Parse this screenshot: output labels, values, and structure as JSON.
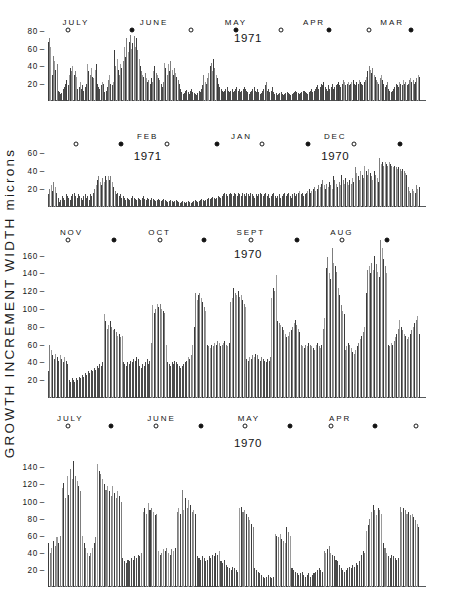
{
  "axis_title": "GROWTH   INCREMENT   WIDTH   microns",
  "chart_data": {
    "type": "bar",
    "title": "GROWTH INCREMENT WIDTH microns",
    "xlabel": "",
    "ylabel": "microns",
    "grid": false,
    "legend": "none",
    "note": "Four stacked panels of daily growth increment widths; time runs right-to-left. Open circle = full moon, filled circle = new moon.",
    "panels": [
      {
        "id": "panel-1",
        "year_label": "1971",
        "ylim": [
          0,
          88
        ],
        "yticks": [
          20,
          40,
          60,
          80
        ],
        "months": [
          "JULY",
          "JUNE",
          "MAY",
          "APR",
          "MAR"
        ],
        "moons": [
          {
            "phase": "full",
            "x": 0.055
          },
          {
            "phase": "new",
            "x": 0.225
          },
          {
            "phase": "full",
            "x": 0.385
          },
          {
            "phase": "new",
            "x": 0.505
          },
          {
            "phase": "full",
            "x": 0.625
          },
          {
            "phase": "new",
            "x": 0.755
          },
          {
            "phase": "full",
            "x": 0.862
          },
          {
            "phase": "new",
            "x": 0.975
          }
        ],
        "values": [
          68,
          72,
          62,
          30,
          52,
          46,
          36,
          42,
          12,
          10,
          8,
          9,
          14,
          16,
          20,
          24,
          18,
          30,
          38,
          34,
          40,
          30,
          34,
          28,
          14,
          16,
          22,
          14,
          18,
          12,
          16,
          20,
          42,
          34,
          30,
          38,
          28,
          26,
          36,
          42,
          20,
          16,
          14,
          18,
          22,
          20,
          10,
          12,
          16,
          24,
          30,
          20,
          18,
          22,
          58,
          40,
          48,
          36,
          30,
          42,
          38,
          46,
          62,
          50,
          72,
          56,
          68,
          76,
          60,
          66,
          74,
          62,
          72,
          58,
          48,
          40,
          34,
          30,
          28,
          32,
          26,
          22,
          24,
          20,
          26,
          22,
          34,
          40,
          32,
          30,
          26,
          24,
          20,
          16,
          22,
          44,
          38,
          30,
          42,
          34,
          46,
          36,
          30,
          38,
          32,
          28,
          24,
          20,
          14,
          10,
          8,
          9,
          11,
          13,
          10,
          8,
          12,
          14,
          10,
          9,
          8,
          7,
          9,
          12,
          10,
          14,
          18,
          30,
          22,
          20,
          26,
          32,
          40,
          44,
          34,
          48,
          38,
          30,
          26,
          20,
          16,
          14,
          12,
          10,
          12,
          14,
          16,
          12,
          10,
          12,
          14,
          10,
          12,
          14,
          16,
          12,
          14,
          10,
          12,
          14,
          16,
          14,
          12,
          10,
          8,
          10,
          12,
          14,
          16,
          12,
          10,
          14,
          10,
          8,
          9,
          11,
          14,
          18,
          22,
          12,
          14,
          10,
          12,
          16,
          10,
          8,
          9,
          7,
          8,
          9,
          10,
          8,
          7,
          8,
          9,
          10,
          9,
          8,
          7,
          8,
          9,
          10,
          12,
          10,
          9,
          8,
          9,
          10,
          11,
          12,
          10,
          9,
          8,
          10,
          12,
          14,
          10,
          12,
          14,
          16,
          18,
          14,
          16,
          20,
          18,
          22,
          16,
          14,
          12,
          18,
          14,
          16,
          20,
          14,
          16,
          18,
          20,
          22,
          18,
          16,
          20,
          24,
          22,
          18,
          20,
          22,
          18,
          20,
          22,
          24,
          20,
          18,
          22,
          20,
          24,
          22,
          20,
          18,
          22,
          24,
          28,
          34,
          40,
          36,
          32,
          38,
          30,
          28,
          24,
          22,
          20,
          26,
          30,
          24,
          20,
          16,
          18,
          22,
          14,
          12,
          10,
          12,
          14,
          16,
          20,
          18,
          16,
          22,
          20,
          18,
          24,
          20,
          22,
          18,
          20,
          24,
          26,
          22,
          24,
          20,
          22,
          26,
          30,
          28
        ]
      },
      {
        "id": "panel-2",
        "year_labels": [
          "1971",
          "1970"
        ],
        "ylim": [
          0,
          70
        ],
        "yticks": [
          20,
          40,
          60
        ],
        "months": [
          "FEB",
          "JAN",
          "DEC"
        ],
        "moons": [
          {
            "phase": "full",
            "x": 0.075
          },
          {
            "phase": "new",
            "x": 0.195
          },
          {
            "phase": "full",
            "x": 0.32
          },
          {
            "phase": "new",
            "x": 0.455
          },
          {
            "phase": "full",
            "x": 0.575
          },
          {
            "phase": "new",
            "x": 0.7
          },
          {
            "phase": "full",
            "x": 0.822
          },
          {
            "phase": "new",
            "x": 0.945
          }
        ],
        "values": [
          14,
          20,
          24,
          18,
          28,
          22,
          16,
          10,
          6,
          8,
          12,
          10,
          8,
          14,
          12,
          10,
          8,
          12,
          14,
          16,
          12,
          10,
          14,
          12,
          10,
          8,
          12,
          14,
          10,
          12,
          8,
          14,
          12,
          16,
          20,
          24,
          30,
          34,
          28,
          24,
          32,
          28,
          34,
          30,
          34,
          30,
          34,
          28,
          22,
          18,
          14,
          16,
          12,
          14,
          10,
          12,
          10,
          8,
          10,
          9,
          8,
          10,
          12,
          10,
          9,
          8,
          10,
          9,
          8,
          10,
          12,
          9,
          8,
          10,
          9,
          8,
          10,
          9,
          8,
          7,
          8,
          9,
          8,
          7,
          8,
          9,
          8,
          7,
          6,
          7,
          8,
          7,
          6,
          7,
          8,
          7,
          6,
          5,
          6,
          7,
          6,
          5,
          6,
          7,
          6,
          5,
          6,
          7,
          8,
          7,
          6,
          7,
          8,
          9,
          8,
          7,
          8,
          9,
          10,
          9,
          10,
          11,
          10,
          9,
          10,
          12,
          11,
          10,
          12,
          14,
          16,
          14,
          12,
          14,
          16,
          14,
          12,
          16,
          14,
          12,
          16,
          14,
          12,
          16,
          14,
          12,
          16,
          14,
          12,
          16,
          14,
          12,
          10,
          14,
          12,
          14,
          16,
          14,
          12,
          14,
          16,
          12,
          14,
          10,
          12,
          14,
          16,
          12,
          10,
          12,
          14,
          10,
          12,
          14,
          16,
          12,
          14,
          16,
          12,
          10,
          14,
          16,
          12,
          14,
          16,
          18,
          14,
          16,
          12,
          14,
          16,
          18,
          20,
          16,
          18,
          20,
          22,
          18,
          20,
          24,
          22,
          26,
          30,
          24,
          20,
          26,
          22,
          28,
          24,
          20,
          34,
          30,
          26,
          22,
          28,
          24,
          36,
          30,
          26,
          32,
          28,
          24,
          30,
          26,
          32,
          28,
          44,
          38,
          34,
          30,
          40,
          36,
          32,
          46,
          40,
          36,
          42,
          38,
          34,
          30,
          40,
          36,
          32,
          28,
          54,
          48,
          50,
          46,
          50,
          48,
          46,
          50,
          48,
          46,
          44,
          46,
          44,
          42,
          44,
          42,
          40,
          42,
          40,
          38,
          36,
          22,
          18,
          16,
          20,
          18,
          16,
          24,
          20,
          22
        ]
      },
      {
        "id": "panel-3",
        "year_label": "1970",
        "ylim": [
          0,
          182
        ],
        "yticks": [
          20,
          40,
          60,
          80,
          100,
          120,
          140,
          160
        ],
        "months": [
          "NOV",
          "OCT",
          "SEPT",
          "AUG"
        ],
        "moons": [
          {
            "phase": "full",
            "x": 0.055
          },
          {
            "phase": "new",
            "x": 0.178
          },
          {
            "phase": "full",
            "x": 0.3
          },
          {
            "phase": "new",
            "x": 0.42
          },
          {
            "phase": "full",
            "x": 0.545
          },
          {
            "phase": "new",
            "x": 0.67
          },
          {
            "phase": "full",
            "x": 0.79
          },
          {
            "phase": "new",
            "x": 0.912
          }
        ],
        "values": [
          30,
          60,
          54,
          48,
          44,
          50,
          46,
          42,
          48,
          44,
          40,
          46,
          42,
          38,
          20,
          18,
          22,
          20,
          18,
          22,
          20,
          24,
          22,
          26,
          24,
          28,
          26,
          30,
          28,
          32,
          30,
          34,
          32,
          36,
          34,
          38,
          36,
          40,
          94,
          86,
          78,
          82,
          86,
          80,
          76,
          78,
          74,
          70,
          72,
          68,
          70,
          40,
          38,
          36,
          40,
          38,
          42,
          40,
          44,
          42,
          46,
          44,
          36,
          34,
          38,
          36,
          40,
          44,
          38,
          42,
          62,
          104,
          96,
          100,
          106,
          102,
          106,
          100,
          98,
          96,
          60,
          40,
          38,
          36,
          40,
          38,
          42,
          40,
          38,
          36,
          34,
          36,
          38,
          40,
          42,
          46,
          44,
          48,
          60,
          80,
          118,
          110,
          116,
          118,
          112,
          108,
          102,
          98,
          60,
          58,
          56,
          60,
          58,
          62,
          60,
          64,
          62,
          58,
          60,
          62,
          64,
          60,
          58,
          62,
          108,
          112,
          124,
          118,
          116,
          120,
          114,
          116,
          110,
          106,
          102,
          44,
          42,
          46,
          44,
          48,
          46,
          50,
          48,
          44,
          42,
          46,
          44,
          42,
          40,
          44,
          42,
          46,
          112,
          124,
          120,
          138,
          86,
          84,
          82,
          80,
          76,
          72,
          68,
          70,
          74,
          76,
          80,
          84,
          88,
          82,
          78,
          74,
          60,
          58,
          56,
          60,
          58,
          62,
          60,
          58,
          56,
          54,
          60,
          62,
          58,
          56,
          60,
          78,
          90,
          146,
          158,
          140,
          134,
          168,
          152,
          148,
          142,
          124,
          116,
          104,
          98,
          94,
          54,
          58,
          62,
          60,
          56,
          52,
          50,
          54,
          58,
          62,
          66,
          70,
          74,
          80,
          118,
          144,
          148,
          140,
          152,
          144,
          160,
          150,
          142,
          136,
          178,
          168,
          156,
          148,
          140,
          60,
          58,
          62,
          60,
          64,
          68,
          72,
          78,
          88,
          80,
          76,
          72,
          70,
          66,
          68,
          72,
          76,
          80,
          84,
          88,
          92,
          72
        ]
      },
      {
        "id": "panel-4",
        "year_label": "1970",
        "ylim": [
          0,
          158
        ],
        "yticks": [
          20,
          40,
          60,
          80,
          100,
          120,
          140
        ],
        "months": [
          "JULY",
          "JUNE",
          "MAY",
          "APR"
        ],
        "moons": [
          {
            "phase": "full",
            "x": 0.054
          },
          {
            "phase": "new",
            "x": 0.17
          },
          {
            "phase": "full",
            "x": 0.29
          },
          {
            "phase": "new",
            "x": 0.41
          },
          {
            "phase": "full",
            "x": 0.53
          },
          {
            "phase": "new",
            "x": 0.65
          },
          {
            "phase": "full",
            "x": 0.762
          },
          {
            "phase": "new",
            "x": 0.878
          },
          {
            "phase": "full",
            "x": 0.99
          }
        ],
        "values": [
          52,
          40,
          46,
          54,
          48,
          58,
          52,
          60,
          116,
          122,
          104,
          130,
          108,
          138,
          126,
          148,
          130,
          124,
          118,
          112,
          60,
          52,
          46,
          40,
          36,
          40,
          46,
          52,
          58,
          144,
          136,
          132,
          126,
          120,
          114,
          118,
          112,
          106,
          118,
          110,
          104,
          112,
          106,
          100,
          34,
          30,
          28,
          32,
          30,
          34,
          32,
          36,
          34,
          38,
          36,
          40,
          88,
          92,
          86,
          98,
          90,
          92,
          88,
          84,
          86,
          42,
          38,
          40,
          44,
          42,
          46,
          40,
          38,
          44,
          42,
          46,
          88,
          92,
          86,
          114,
          90,
          104,
          92,
          102,
          96,
          88,
          90,
          86,
          36,
          34,
          32,
          36,
          34,
          30,
          32,
          36,
          34,
          38,
          36,
          40,
          38,
          42,
          30,
          28,
          32,
          26,
          24,
          22,
          20,
          24,
          22,
          20,
          18,
          92,
          94,
          88,
          90,
          86,
          82,
          78,
          74,
          70,
          22,
          20,
          18,
          16,
          14,
          12,
          10,
          12,
          14,
          12,
          10,
          12,
          62,
          60,
          58,
          62,
          56,
          54,
          52,
          70,
          64,
          60,
          22,
          20,
          18,
          16,
          14,
          16,
          18,
          14,
          12,
          14,
          16,
          12,
          14,
          16,
          18,
          20,
          22,
          20,
          18,
          42,
          40,
          44,
          48,
          40,
          38,
          36,
          32,
          30,
          26,
          22,
          20,
          18,
          20,
          22,
          24,
          22,
          26,
          24,
          28,
          26,
          30,
          38,
          42,
          40,
          66,
          72,
          80,
          88,
          96,
          90,
          84,
          92,
          90,
          86,
          52,
          46,
          40,
          36,
          34,
          38,
          36,
          34,
          32,
          34,
          94,
          88,
          92,
          90,
          86,
          88,
          84,
          86,
          82,
          78,
          74,
          70
        ]
      }
    ]
  }
}
